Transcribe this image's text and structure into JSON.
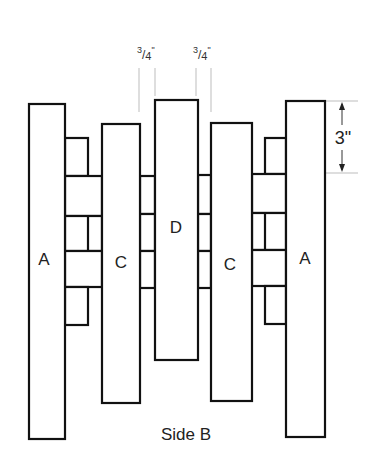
{
  "diagram": {
    "caption": "Side B",
    "boards": [
      {
        "label": "A",
        "x": 29,
        "y": 104,
        "w": 36,
        "h": 335
      },
      {
        "label": "C",
        "x": 102,
        "y": 124,
        "w": 38,
        "h": 279
      },
      {
        "label": "D",
        "x": 155,
        "y": 100,
        "w": 43,
        "h": 260
      },
      {
        "label": "C",
        "x": 211,
        "y": 123,
        "w": 41,
        "h": 278
      },
      {
        "label": "A",
        "x": 286,
        "y": 101,
        "w": 39,
        "h": 336
      }
    ],
    "dimensions": {
      "gap_left": {
        "numerator": "3",
        "denominator": "4",
        "unit": "\""
      },
      "gap_right": {
        "numerator": "3",
        "denominator": "4",
        "unit": "\""
      },
      "block_height": "3\""
    },
    "labels": {
      "a_left": "A",
      "c_left": "C",
      "d_center": "D",
      "c_right": "C",
      "a_right": "A"
    }
  }
}
